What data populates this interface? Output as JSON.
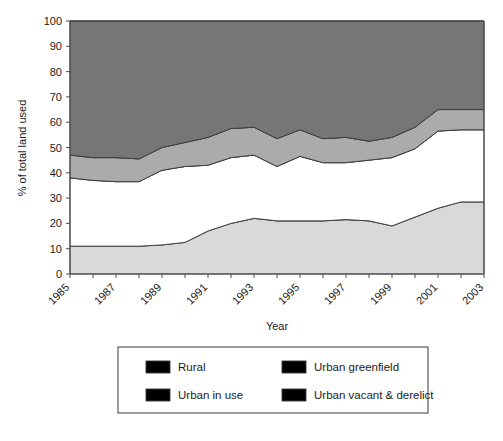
{
  "chart_data": {
    "type": "area",
    "stacked": true,
    "title": "",
    "xlabel": "Year",
    "ylabel": "% of total land used",
    "xlim": [
      1985,
      2003
    ],
    "ylim": [
      0,
      100
    ],
    "grid": false,
    "legend_position": "bottom",
    "x": [
      1985,
      1986,
      1987,
      1988,
      1989,
      1990,
      1991,
      1992,
      1993,
      1994,
      1995,
      1996,
      1997,
      1998,
      1999,
      2000,
      2001,
      2002,
      2003
    ],
    "x_tick_labels": [
      "1985",
      "1987",
      "1989",
      "1991",
      "1993",
      "1995",
      "1997",
      "1999",
      "2001",
      "2003"
    ],
    "x_tick_values": [
      1985,
      1987,
      1989,
      1991,
      1993,
      1995,
      1997,
      1999,
      2001,
      2003
    ],
    "y_tick_labels": [
      "0",
      "10",
      "20",
      "30",
      "40",
      "50",
      "60",
      "70",
      "80",
      "90",
      "100"
    ],
    "y_tick_values": [
      0,
      10,
      20,
      30,
      40,
      50,
      60,
      70,
      80,
      90,
      100
    ],
    "series": [
      {
        "name": "Urban vacant & derelict",
        "color": "#d9d9d9",
        "values": [
          11,
          11,
          11,
          11,
          11.5,
          12.5,
          17,
          20,
          22,
          21,
          21,
          21,
          21.5,
          21,
          19,
          22.5,
          26,
          28.5,
          28.5
        ]
      },
      {
        "name": "Urban in use",
        "color": "#ffffff",
        "values": [
          27,
          26,
          25.5,
          25.5,
          29.5,
          30,
          26,
          26,
          25,
          21.5,
          25.5,
          23,
          22.5,
          24,
          27,
          27,
          30.5,
          28.5,
          28.5
        ]
      },
      {
        "name": "Urban greenfield",
        "color": "#ababab",
        "values": [
          9,
          9,
          9.5,
          9,
          9,
          9.5,
          11,
          11.5,
          11,
          11,
          10.5,
          9.5,
          10,
          7.5,
          8,
          8.5,
          8.5,
          8,
          8
        ]
      },
      {
        "name": "Rural",
        "color": "#767676",
        "values": [
          53,
          54,
          54,
          54.5,
          50,
          48,
          46,
          42.5,
          42,
          46.5,
          43,
          46.5,
          46,
          47.5,
          46,
          42,
          35,
          35,
          35
        ]
      }
    ],
    "cumulative_tops": {
      "urban_vacant_derelict": [
        11,
        11,
        11,
        11,
        11.5,
        12.5,
        17,
        20,
        22,
        21,
        21,
        21,
        21.5,
        21,
        19,
        22.5,
        26,
        28.5,
        28.5
      ],
      "urban_in_use": [
        38,
        37,
        36.5,
        36.5,
        41,
        42.5,
        43,
        46,
        47,
        42.5,
        46.5,
        44,
        44,
        45,
        46,
        49.5,
        56.5,
        57,
        57
      ],
      "urban_greenfield": [
        47,
        46,
        46,
        45.5,
        50,
        52,
        54,
        57.5,
        58,
        53.5,
        57,
        53.5,
        54,
        52.5,
        54,
        58,
        65,
        65,
        65
      ],
      "rural": [
        100,
        100,
        100,
        100,
        100,
        100,
        100,
        100,
        100,
        100,
        100,
        100,
        100,
        100,
        100,
        100,
        100,
        100,
        100
      ]
    }
  },
  "legend": {
    "entries": [
      {
        "label": "Rural",
        "color": "#767676"
      },
      {
        "label": "Urban greenfield",
        "color": "#ababab"
      },
      {
        "label": "Urban in use",
        "color": "#ffffff"
      },
      {
        "label": "Urban vacant & derelict",
        "color": "#d9d9d9"
      }
    ]
  },
  "footer": {
    "caption": ""
  }
}
